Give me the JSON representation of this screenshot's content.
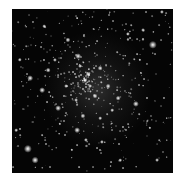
{
  "image": {
    "subject": "star cluster",
    "background_color": "#050505",
    "star_color": "#ffffff",
    "frame": {
      "left": 12,
      "top": 9,
      "width": 161,
      "height": 164
    },
    "cluster_center": {
      "x": 85,
      "y": 80
    },
    "bright_stars": [
      {
        "x": 153,
        "y": 45,
        "r": 3.2
      },
      {
        "x": 28,
        "y": 149,
        "r": 3.2
      },
      {
        "x": 35,
        "y": 160,
        "r": 2.6
      },
      {
        "x": 136,
        "y": 104,
        "r": 2.4
      },
      {
        "x": 78,
        "y": 56,
        "r": 2.2
      },
      {
        "x": 68,
        "y": 40,
        "r": 2.0
      },
      {
        "x": 30,
        "y": 78,
        "r": 2.2
      },
      {
        "x": 42,
        "y": 90,
        "r": 2.2
      },
      {
        "x": 58,
        "y": 108,
        "r": 2.2
      },
      {
        "x": 77,
        "y": 130,
        "r": 2.2
      },
      {
        "x": 83,
        "y": 116,
        "r": 2.0
      },
      {
        "x": 95,
        "y": 96,
        "r": 1.9
      },
      {
        "x": 88,
        "y": 74,
        "r": 1.9
      },
      {
        "x": 100,
        "y": 68,
        "r": 1.8
      },
      {
        "x": 108,
        "y": 86,
        "r": 1.8
      },
      {
        "x": 118,
        "y": 98,
        "r": 1.8
      },
      {
        "x": 48,
        "y": 70,
        "r": 1.8
      },
      {
        "x": 20,
        "y": 60,
        "r": 1.7
      },
      {
        "x": 55,
        "y": 60,
        "r": 1.6
      },
      {
        "x": 128,
        "y": 34,
        "r": 1.6
      },
      {
        "x": 143,
        "y": 30,
        "r": 1.5
      },
      {
        "x": 162,
        "y": 12,
        "r": 1.6
      },
      {
        "x": 44,
        "y": 26,
        "r": 1.4
      },
      {
        "x": 86,
        "y": 140,
        "r": 1.6
      },
      {
        "x": 102,
        "y": 142,
        "r": 1.6
      },
      {
        "x": 120,
        "y": 160,
        "r": 1.4
      },
      {
        "x": 157,
        "y": 160,
        "r": 1.5
      },
      {
        "x": 16,
        "y": 130,
        "r": 1.4
      },
      {
        "x": 66,
        "y": 86,
        "r": 1.5
      },
      {
        "x": 76,
        "y": 100,
        "r": 1.5
      },
      {
        "x": 90,
        "y": 86,
        "r": 1.5
      },
      {
        "x": 80,
        "y": 66,
        "r": 1.5
      },
      {
        "x": 112,
        "y": 110,
        "r": 1.4
      },
      {
        "x": 140,
        "y": 60,
        "r": 1.3
      },
      {
        "x": 150,
        "y": 128,
        "r": 1.3
      },
      {
        "x": 60,
        "y": 124,
        "r": 1.3
      },
      {
        "x": 100,
        "y": 118,
        "r": 1.4
      },
      {
        "x": 72,
        "y": 150,
        "r": 1.3
      }
    ],
    "faint_star_count": 520,
    "faint_star_seed": 7
  }
}
